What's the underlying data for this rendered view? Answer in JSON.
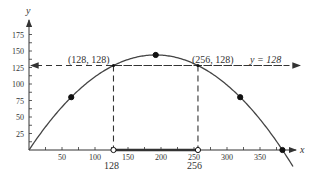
{
  "chart_data": {
    "type": "line",
    "title": "",
    "xlabel": "x",
    "ylabel": "y",
    "xlim": [
      0,
      400
    ],
    "ylim": [
      0,
      190
    ],
    "x_ticks": [
      50,
      100,
      150,
      200,
      250,
      300,
      350
    ],
    "y_ticks": [
      25,
      50,
      75,
      100,
      125,
      150,
      175
    ],
    "series": [
      {
        "name": "parabola y = x(384 - x)/256",
        "x": [
          0,
          64,
          128,
          192,
          256,
          320,
          384
        ],
        "values": [
          0,
          80,
          128,
          144,
          128,
          80,
          0
        ]
      }
    ],
    "marked_points": [
      {
        "x": 64,
        "y": 80,
        "style": "filled"
      },
      {
        "x": 192,
        "y": 144,
        "style": "filled"
      },
      {
        "x": 320,
        "y": 80,
        "style": "filled"
      },
      {
        "x": 384,
        "y": 0,
        "style": "filled"
      },
      {
        "x": 128,
        "y": 0,
        "style": "open"
      },
      {
        "x": 256,
        "y": 0,
        "style": "open"
      }
    ],
    "horizontal_line": {
      "y": 128,
      "label": "y = 128",
      "style": "dashed"
    },
    "annotations": [
      "(128, 128)",
      "(256, 128)",
      "128",
      "256"
    ],
    "highlighted_interval": [
      128,
      256
    ],
    "grid": false,
    "legend": "none"
  },
  "labels": {
    "x_axis": "x",
    "y_axis": "y",
    "point_left": "(128, 128)",
    "point_right": "(256, 128)",
    "line_label": "y = 128",
    "x_mark_left": "128",
    "x_mark_right": "256"
  }
}
